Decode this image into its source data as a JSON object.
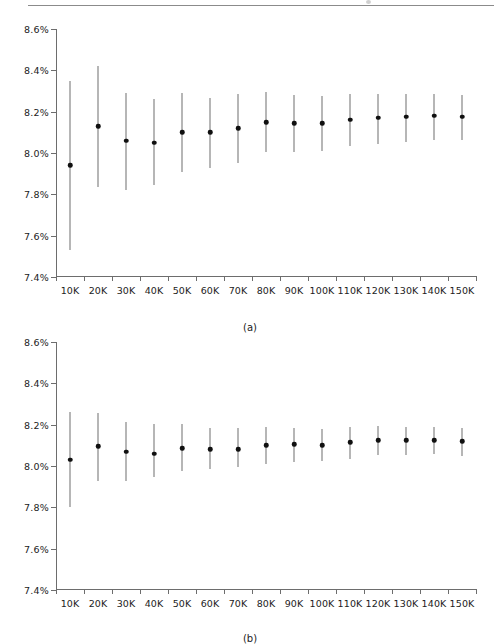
{
  "figure": {
    "top_rule": true,
    "panels": [
      {
        "caption": "(a)"
      },
      {
        "caption": "(b)"
      }
    ]
  },
  "axis": {
    "y_ticks": [
      "7.4%",
      "7.6%",
      "7.8%",
      "8.0%",
      "8.2%",
      "8.4%",
      "8.6%"
    ],
    "x_ticks": [
      "10K",
      "20K",
      "30K",
      "40K",
      "50K",
      "60K",
      "70K",
      "80K",
      "90K",
      "100K",
      "110K",
      "120K",
      "130K",
      "140K",
      "150K"
    ]
  },
  "colors": {
    "axis": "#6d6d6d",
    "error_bar": "#6f6f6f",
    "marker": "#101010",
    "text": "#222222",
    "rule": "#8b8b8b",
    "background": "#ffffff"
  },
  "chart_data": [
    {
      "type": "scatter",
      "title": "(a)",
      "xlabel": "",
      "ylabel": "",
      "grid": false,
      "legend": "none",
      "ylim": [
        7.4,
        8.6
      ],
      "ytick_values": [
        7.4,
        7.6,
        7.8,
        8.0,
        8.2,
        8.4,
        8.6
      ],
      "ytick_labels": [
        "7.4%",
        "7.6%",
        "7.8%",
        "8.0%",
        "8.2%",
        "8.4%",
        "8.6%"
      ],
      "categories": [
        "10K",
        "20K",
        "30K",
        "40K",
        "50K",
        "60K",
        "70K",
        "80K",
        "90K",
        "100K",
        "110K",
        "120K",
        "130K",
        "140K",
        "150K"
      ],
      "values": [
        7.94,
        8.13,
        8.06,
        8.05,
        8.1,
        8.1,
        8.12,
        8.15,
        8.145,
        8.145,
        8.16,
        8.17,
        8.175,
        8.18,
        8.175
      ],
      "error_low": [
        7.53,
        7.835,
        7.82,
        7.845,
        7.91,
        7.925,
        7.95,
        8.005,
        8.005,
        8.01,
        8.035,
        8.045,
        8.055,
        8.065,
        8.065
      ],
      "error_high": [
        8.35,
        8.42,
        8.29,
        8.26,
        8.29,
        8.265,
        8.285,
        8.295,
        8.28,
        8.275,
        8.285,
        8.285,
        8.285,
        8.285,
        8.28
      ]
    },
    {
      "type": "scatter",
      "title": "(b)",
      "xlabel": "",
      "ylabel": "",
      "grid": false,
      "legend": "none",
      "ylim": [
        7.4,
        8.6
      ],
      "ytick_values": [
        7.4,
        7.6,
        7.8,
        8.0,
        8.2,
        8.4,
        8.6
      ],
      "ytick_labels": [
        "7.4%",
        "7.6%",
        "7.8%",
        "8.0%",
        "8.2%",
        "8.4%",
        "8.6%"
      ],
      "categories": [
        "10K",
        "20K",
        "30K",
        "40K",
        "50K",
        "60K",
        "70K",
        "80K",
        "90K",
        "100K",
        "110K",
        "120K",
        "130K",
        "140K",
        "150K"
      ],
      "values": [
        8.03,
        8.095,
        8.07,
        8.06,
        8.085,
        8.08,
        8.08,
        8.1,
        8.105,
        8.1,
        8.115,
        8.125,
        8.125,
        8.125,
        8.12
      ],
      "error_low": [
        7.8,
        7.925,
        7.925,
        7.945,
        7.975,
        7.985,
        7.995,
        8.01,
        8.02,
        8.025,
        8.035,
        8.055,
        8.055,
        8.06,
        8.05
      ],
      "error_high": [
        8.26,
        8.255,
        8.215,
        8.205,
        8.205,
        8.185,
        8.185,
        8.19,
        8.185,
        8.18,
        8.19,
        8.195,
        8.19,
        8.19,
        8.185
      ]
    }
  ]
}
